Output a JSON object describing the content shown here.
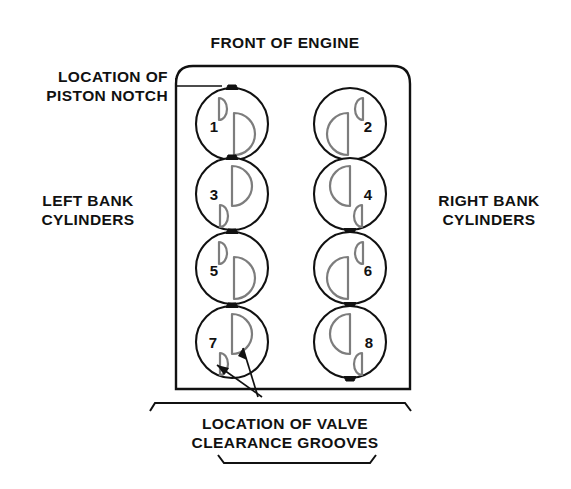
{
  "diagram": {
    "title_top": "FRONT OF ENGINE",
    "label_left_top_line1": "LOCATION OF",
    "label_left_top_line2": "PISTON NOTCH",
    "label_left_bank_line1": "LEFT BANK",
    "label_left_bank_line2": "CYLINDERS",
    "label_right_bank_line1": "RIGHT BANK",
    "label_right_bank_line2": "CYLINDERS",
    "label_bottom_line1": "LOCATION OF VALVE",
    "label_bottom_line2": "CLEARANCE GROOVES",
    "colors": {
      "ink": "#111111",
      "groove_stroke": "#7d7d7d",
      "background": "#ffffff"
    }
  },
  "cylinders": [
    {
      "number": "1",
      "bank": "left",
      "notch_position": "top",
      "large_groove": "right-opening-right",
      "small_groove": "upper-left"
    },
    {
      "number": "2",
      "bank": "right",
      "notch_position": "bottom",
      "large_groove": "left-opening-left",
      "small_groove": "upper-right"
    },
    {
      "number": "3",
      "bank": "left",
      "notch_position": "top",
      "large_groove": "upper-right",
      "small_groove": "lower-left"
    },
    {
      "number": "4",
      "bank": "right",
      "notch_position": "bottom",
      "large_groove": "upper-left",
      "small_groove": "lower-right"
    },
    {
      "number": "5",
      "bank": "left",
      "notch_position": "top",
      "large_groove": "right-opening-right",
      "small_groove": "upper-left"
    },
    {
      "number": "6",
      "bank": "right",
      "notch_position": "bottom",
      "large_groove": "left-opening-left",
      "small_groove": "upper-right"
    },
    {
      "number": "7",
      "bank": "left",
      "notch_position": "top",
      "large_groove": "upper-right",
      "small_groove": "lower-left"
    },
    {
      "number": "8",
      "bank": "right",
      "notch_position": "bottom",
      "large_groove": "upper-left",
      "small_groove": "lower-right"
    }
  ]
}
